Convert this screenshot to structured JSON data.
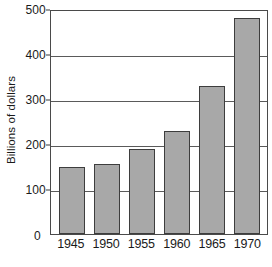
{
  "chart_data": {
    "type": "bar",
    "title": "",
    "subtitle": "",
    "xlabel": "",
    "ylabel": "Billions of dollars",
    "categories": [
      "1945",
      "1950",
      "1955",
      "1960",
      "1965",
      "1970"
    ],
    "values": [
      150,
      155,
      190,
      228,
      330,
      480
    ],
    "series": [
      {
        "name": "",
        "values": [
          150,
          155,
          190,
          228,
          330,
          480
        ]
      }
    ],
    "ylim": [
      0,
      500
    ],
    "yticks": [
      0,
      100,
      200,
      300,
      400,
      500
    ],
    "ytick_labels": [
      "0",
      "100",
      "200",
      "300",
      "400",
      "500"
    ],
    "grid": true,
    "grid_axis": "y",
    "legend": false,
    "legend_position": "none",
    "annotations": [],
    "colors": {
      "bar_fill": "#a8a8a8",
      "bar_edge": "#3d3d3d",
      "frame": "#4a4a4a",
      "gridline": "#5a5a5a",
      "text": "#1a1a1a",
      "background": "#ffffff"
    }
  }
}
